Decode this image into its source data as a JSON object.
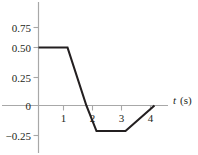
{
  "chart_data": {
    "type": "line",
    "title": "",
    "subtitle": "",
    "xlabel": "t (s)",
    "xlabel_symbol": "t",
    "xlabel_unit": "(s)",
    "ylabel": "",
    "xlim": [
      0,
      4.6
    ],
    "ylim": [
      -0.32,
      0.88
    ],
    "grid": false,
    "legend": null,
    "x_ticks": [
      1,
      2,
      3,
      4
    ],
    "x_tick_labels": [
      "1",
      "2",
      "3",
      "4"
    ],
    "y_ticks": [
      0.75,
      0.5,
      0.25,
      0,
      -0.25
    ],
    "y_tick_labels": [
      "0.75",
      "0.50",
      "0.25",
      "0",
      "−0.25"
    ],
    "series": [
      {
        "name": "signal",
        "color": "#231f20",
        "x": [
          0,
          1,
          1.65,
          2,
          3,
          4
        ],
        "y": [
          0.5,
          0.5,
          0,
          -0.22,
          -0.22,
          0
        ]
      }
    ],
    "annotations": [],
    "axis_color": "#a8a8a8",
    "curve_color": "#231f20",
    "background_color": "#ffffff"
  },
  "figure": {
    "axis_label_x": "t",
    "axis_unit_x": "(s)"
  }
}
